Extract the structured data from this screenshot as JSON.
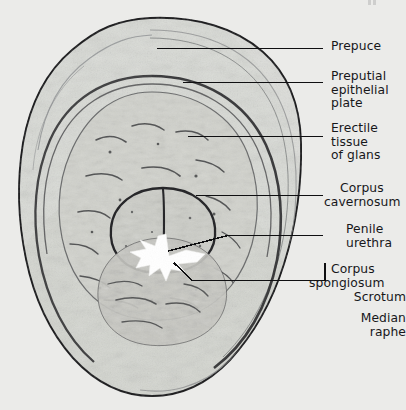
{
  "figure": {
    "kind": "histology-photomicrograph",
    "background_color": "#ebebe9",
    "ink_color": "#17171a"
  },
  "labels": [
    {
      "id": "prepuce",
      "lines": [
        "Prepuce"
      ],
      "x": 331,
      "y": 40,
      "align": "left"
    },
    {
      "id": "preputial-epithelial-plate",
      "lines": [
        "Preputial",
        "epithelial",
        "plate"
      ],
      "x": 331,
      "y": 70,
      "align": "left"
    },
    {
      "id": "erectile-tissue-of-glans",
      "lines": [
        "Erectile",
        "tissue",
        "of glans"
      ],
      "x": 331,
      "y": 122,
      "align": "left"
    },
    {
      "id": "corpus-cavernosum",
      "lines": [
        "Corpus",
        "cavernosum"
      ],
      "x": 324,
      "y": 182,
      "align": "left"
    },
    {
      "id": "penile-urethra",
      "lines": [
        "Penile",
        "urethra"
      ],
      "x": 337,
      "y": 223,
      "align": "left"
    },
    {
      "id": "corpus-spongiosum",
      "lines": [
        "Corpus",
        "spongiosum"
      ],
      "x": 330,
      "y": 263,
      "align": "left"
    },
    {
      "id": "scrotum",
      "lines": [
        "Scrotum"
      ],
      "x": 406,
      "y": 291,
      "align": "right"
    },
    {
      "id": "median-raphe",
      "lines": [
        "Median",
        "raphe"
      ],
      "x": 406,
      "y": 312,
      "align": "right"
    }
  ],
  "leader_lines": [
    {
      "id": "leader-prepuce",
      "target": "prepuce",
      "path": "M157,48.5 L323,48.5"
    },
    {
      "id": "leader-preputial-plate",
      "target": "preputial-epithocal",
      "path": "M183,82.5 L323,82.5"
    },
    {
      "id": "leader-erectile-tissue",
      "target": "erectile-tissue",
      "path": "M188,136.5 L323,136.5"
    },
    {
      "id": "leader-corpus-cavernosum",
      "target": "corpus-cavernosum",
      "path": "M196,195.5 L323,195.5"
    },
    {
      "id": "leader-penile-urethra",
      "target": "penile-urethra",
      "path": "M168,250 L228,235.5 L323,235.5"
    },
    {
      "id": "leader-corpus-spongiosum",
      "target": "corpus-spongiosum",
      "path": "M175,264 L192,280.5 L325,280.5 L325,262"
    }
  ],
  "structures": [
    {
      "id": "outer-skin-boundary",
      "name": "prepuce outer surface"
    },
    {
      "id": "preputial-plate-ring",
      "name": "preputial epithelial plate"
    },
    {
      "id": "glans-erectile-mass",
      "name": "erectile tissue of glans"
    },
    {
      "id": "corpus-cavernosum-left",
      "name": "left corpus cavernosum"
    },
    {
      "id": "corpus-cavernosum-right",
      "name": "right corpus cavernosum"
    },
    {
      "id": "urethral-lumen",
      "name": "penile urethral lumen",
      "fill": "#ffffff"
    },
    {
      "id": "corpus-spongiosum-mass",
      "name": "corpus spongiosum"
    }
  ]
}
